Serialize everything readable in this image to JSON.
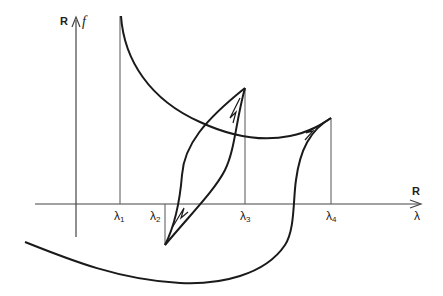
{
  "diagram": {
    "y_axis": {
      "set_label": "R",
      "var_label": "f"
    },
    "x_axis": {
      "set_label": "R",
      "var_label": "λ"
    },
    "ticks": [
      {
        "sym": "λ",
        "sub": "1"
      },
      {
        "sym": "λ",
        "sub": "2"
      },
      {
        "sym": "λ",
        "sub": "3"
      },
      {
        "sym": "λ",
        "sub": "4"
      }
    ],
    "colors": {
      "stroke": "#1a1a1a",
      "guide": "#444444"
    }
  }
}
